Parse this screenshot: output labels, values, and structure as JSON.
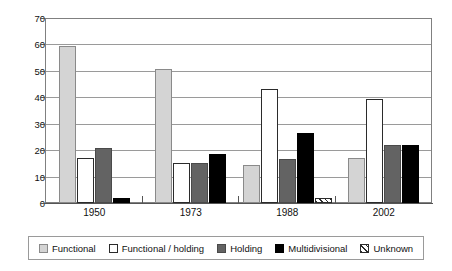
{
  "chart_data": {
    "type": "bar",
    "title": "",
    "xlabel": "",
    "ylabel": "",
    "categories": [
      "1950",
      "1973",
      "1988",
      "2002"
    ],
    "ylim": [
      0,
      70
    ],
    "yticks": [
      0,
      10,
      20,
      30,
      40,
      50,
      60,
      70
    ],
    "grid": true,
    "legend_position": "bottom",
    "series": [
      {
        "name": "Functional",
        "color": "#d4d4d4",
        "values": [
          59.5,
          50.8,
          14.5,
          17.2
        ]
      },
      {
        "name": "Functional / holding",
        "color": "#ffffff",
        "values": [
          17.2,
          15.2,
          43.0,
          39.5
        ]
      },
      {
        "name": "Holding",
        "color": "#636363",
        "values": [
          21.0,
          15.1,
          16.5,
          22.0
        ]
      },
      {
        "name": "Multidivisional",
        "color": "#000000",
        "values": [
          1.8,
          18.4,
          26.5,
          22.0
        ]
      },
      {
        "name": "Unknown",
        "color": "#ffffff",
        "values": [
          0,
          0,
          2.0,
          0
        ]
      }
    ]
  },
  "axis": {
    "y_tick_labels": [
      "70",
      "60",
      "50",
      "40",
      "30",
      "20",
      "10",
      "0"
    ],
    "x_tick_labels": [
      "1950",
      "1973",
      "1988",
      "2002"
    ]
  },
  "legend": {
    "items": [
      {
        "label": "Functional",
        "swatch": "swatch-functional"
      },
      {
        "label": "Functional / holding",
        "swatch": "swatch-functional-holding"
      },
      {
        "label": "Holding",
        "swatch": "swatch-holding"
      },
      {
        "label": "Multidivisional",
        "swatch": "swatch-multidivisional"
      },
      {
        "label": "Unknown",
        "swatch": "swatch-unknown"
      }
    ]
  }
}
